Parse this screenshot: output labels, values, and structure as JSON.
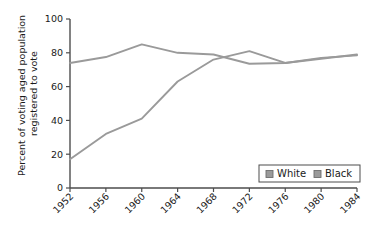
{
  "chart_data": {
    "type": "line",
    "title": "",
    "xlabel": "",
    "ylabel": "Percent of voting aged population registered to vote",
    "ylabel_line1": "Percent of voting aged population",
    "ylabel_line2": "registered to vote",
    "categories": [
      "1952",
      "1956",
      "1960",
      "1964",
      "1968",
      "1972",
      "1976",
      "1980",
      "1984"
    ],
    "x": [
      1952,
      1956,
      1960,
      1964,
      1968,
      1972,
      1976,
      1980,
      1984
    ],
    "xlim": [
      1952,
      1984
    ],
    "ylim": [
      0,
      100
    ],
    "yticks": [
      0,
      20,
      40,
      60,
      80,
      100
    ],
    "ytick_labels": [
      "0",
      "20",
      "40",
      "60",
      "80",
      "100"
    ],
    "grid": false,
    "legend_position": "lower right",
    "series": [
      {
        "name": "White",
        "color": "#9a9a9a",
        "values": [
          74,
          77.5,
          85,
          80,
          79,
          73.5,
          74,
          76.5,
          79
        ]
      },
      {
        "name": "Black",
        "color": "#9a9a9a",
        "values": [
          17,
          32,
          41,
          63,
          76,
          81,
          74,
          77,
          78.5
        ]
      }
    ]
  },
  "legend": {
    "entries": [
      {
        "label": "White",
        "swatch_color": "#9a9a9a"
      },
      {
        "label": "Black",
        "swatch_color": "#9a9a9a"
      }
    ]
  },
  "axis": {
    "spine_color": "#4d4d4d",
    "text_color": "#1a1a1a",
    "xtick_rotation": "45"
  },
  "background_color": "#ffffff"
}
